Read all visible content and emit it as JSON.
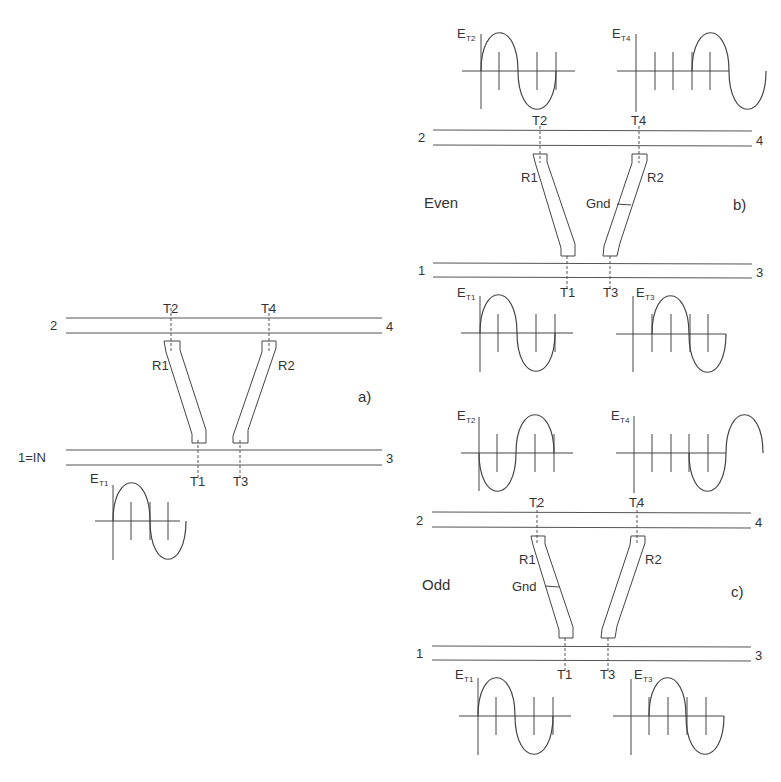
{
  "figure": {
    "panel_a": {
      "tag": "a)",
      "ports": {
        "p1": "1=IN",
        "p2": "2",
        "p3": "3",
        "p4": "4"
      },
      "taps": {
        "t1": "T1",
        "t2": "T2",
        "t3": "T3",
        "t4": "T4"
      },
      "resonators": {
        "r1": "R1",
        "r2": "R2"
      },
      "wave": {
        "label": "E",
        "sub": "T1"
      }
    },
    "panel_b": {
      "tag": "b)",
      "mode": "Even",
      "ports": {
        "p1": "1",
        "p2": "2",
        "p3": "3",
        "p4": "4"
      },
      "taps": {
        "t1": "T1",
        "t2": "T2",
        "t3": "T3",
        "t4": "T4"
      },
      "resonators": {
        "r1": "R1",
        "r2": "R2"
      },
      "ground": "Gnd",
      "waves": {
        "w_t2": {
          "label": "E",
          "sub": "T2"
        },
        "w_t4": {
          "label": "E",
          "sub": "T4"
        },
        "w_t1": {
          "label": "E",
          "sub": "T1"
        },
        "w_t3": {
          "label": "E",
          "sub": "T3"
        }
      }
    },
    "panel_c": {
      "tag": "c)",
      "mode": "Odd",
      "ports": {
        "p1": "1",
        "p2": "2",
        "p3": "3",
        "p4": "4"
      },
      "taps": {
        "t1": "T1",
        "t2": "T2",
        "t3": "T3",
        "t4": "T4"
      },
      "resonators": {
        "r1": "R1",
        "r2": "R2"
      },
      "ground": "Gnd",
      "waves": {
        "w_t2": {
          "label": "E",
          "sub": "T2"
        },
        "w_t4": {
          "label": "E",
          "sub": "T4"
        },
        "w_t1": {
          "label": "E",
          "sub": "T1"
        },
        "w_t3": {
          "label": "E",
          "sub": "T3"
        }
      }
    }
  }
}
